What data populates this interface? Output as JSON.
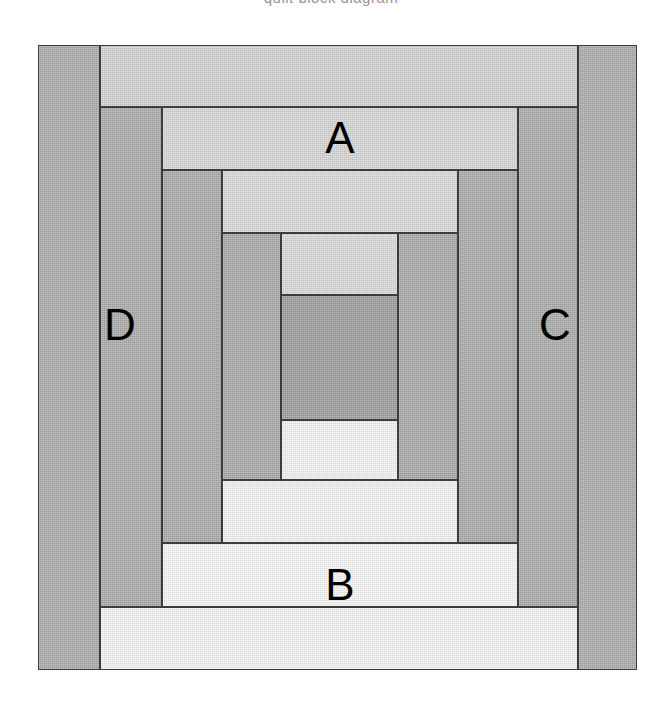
{
  "page": {
    "cut_off_heading": "quilt block diagram",
    "background": "#ffffff",
    "width": 662,
    "height": 708
  },
  "block": {
    "name": "log-cabin-quilt-block",
    "origin": {
      "x": 38,
      "y": 45
    },
    "size": {
      "width": 599,
      "height": 625
    },
    "outline_color": "#3c3c3c",
    "vertical_boundaries": [
      0,
      62,
      124,
      184,
      243,
      360,
      420,
      480,
      540,
      599
    ],
    "horizontal_boundaries": [
      0,
      62,
      125,
      188,
      250,
      375,
      435,
      498,
      562,
      625
    ],
    "palette": {
      "center_dark": "#9a9a9a",
      "dark_1": "#a8a8a8",
      "dark_2": "#a6a6a6",
      "dark_3": "#a8a8a8",
      "dark_4": "#a9a9a9",
      "light_1": "#d2d2d2",
      "light_2": "#dcdcdc",
      "light_3": "#e6e6e6",
      "light_4": "#f0f0f0",
      "light_5": "#f6f6f6"
    },
    "pieces": [
      {
        "id": "center",
        "name": "center-square",
        "x": 243,
        "y": 250,
        "w": 117,
        "h": 125,
        "fill": "#9a9a9a"
      },
      {
        "id": "r1-top",
        "name": "round1-top-strip",
        "x": 243,
        "y": 188,
        "w": 117,
        "h": 62,
        "fill": "#d8d8d8"
      },
      {
        "id": "r1-bot",
        "name": "round1-bottom-strip",
        "x": 243,
        "y": 375,
        "w": 117,
        "h": 60,
        "fill": "#f2f2f2"
      },
      {
        "id": "r1-left",
        "name": "round1-left-strip",
        "x": 184,
        "y": 188,
        "w": 59,
        "h": 247,
        "fill": "#a6a6a6"
      },
      {
        "id": "r1-right",
        "name": "round1-right-strip",
        "x": 360,
        "y": 188,
        "w": 60,
        "h": 247,
        "fill": "#a6a6a6"
      },
      {
        "id": "r2-top",
        "name": "round2-top-strip",
        "x": 184,
        "y": 125,
        "w": 236,
        "h": 63,
        "fill": "#d8d8d8"
      },
      {
        "id": "r2-bot",
        "name": "round2-bottom-strip",
        "x": 184,
        "y": 435,
        "w": 236,
        "h": 63,
        "fill": "#f2f2f2"
      },
      {
        "id": "r2-left",
        "name": "round2-left-strip",
        "x": 124,
        "y": 125,
        "w": 60,
        "h": 373,
        "fill": "#a8a8a8"
      },
      {
        "id": "r2-right",
        "name": "round2-right-strip",
        "x": 420,
        "y": 125,
        "w": 60,
        "h": 373,
        "fill": "#a8a8a8"
      },
      {
        "id": "r3-top",
        "name": "round3-top-strip-A",
        "x": 124,
        "y": 62,
        "w": 356,
        "h": 63,
        "fill": "#d4d4d4"
      },
      {
        "id": "r3-bot",
        "name": "round3-bottom-strip-B",
        "x": 124,
        "y": 498,
        "w": 356,
        "h": 64,
        "fill": "#f6f6f6"
      },
      {
        "id": "r3-left",
        "name": "round3-left-strip-D",
        "x": 62,
        "y": 62,
        "w": 62,
        "h": 500,
        "fill": "#a8a8a8"
      },
      {
        "id": "r3-right",
        "name": "round3-right-strip-C",
        "x": 480,
        "y": 62,
        "w": 60,
        "h": 500,
        "fill": "#a8a8a8"
      },
      {
        "id": "r4-top",
        "name": "round4-top-strip",
        "x": 62,
        "y": 0,
        "w": 478,
        "h": 62,
        "fill": "#d2d2d2"
      },
      {
        "id": "r4-bot",
        "name": "round4-bottom-strip",
        "x": 62,
        "y": 562,
        "w": 478,
        "h": 63,
        "fill": "#f4f4f4"
      },
      {
        "id": "r4-left",
        "name": "round4-left-strip",
        "x": 0,
        "y": 0,
        "w": 62,
        "h": 625,
        "fill": "#a9a9a9"
      },
      {
        "id": "r4-right",
        "name": "round4-right-strip",
        "x": 540,
        "y": 0,
        "w": 59,
        "h": 625,
        "fill": "#a9a9a9"
      }
    ],
    "labels": [
      {
        "id": "A",
        "name": "label-A",
        "text": "A",
        "x": 302,
        "y": 93
      },
      {
        "id": "D",
        "name": "label-D",
        "text": "D",
        "x": 82,
        "y": 280
      },
      {
        "id": "C",
        "name": "label-C",
        "text": "C",
        "x": 517,
        "y": 280
      },
      {
        "id": "B",
        "name": "label-B",
        "text": "B",
        "x": 302,
        "y": 540
      }
    ]
  }
}
